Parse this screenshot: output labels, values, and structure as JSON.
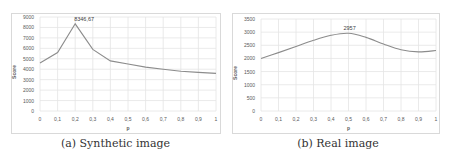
{
  "figure": {
    "captions": [
      "(a) Synthetic image",
      "(b) Real image"
    ]
  },
  "colors": {
    "line": "#8c8c8c",
    "grid": "#e4e4e4",
    "frame": "#d9d9d9",
    "tick_text": "#595959",
    "annotation": "#404040"
  },
  "chart_data": [
    {
      "type": "line",
      "title": "",
      "xlabel": "p",
      "ylabel": "Score",
      "x": [
        0,
        0.1,
        0.2,
        0.3,
        0.4,
        0.5,
        0.6,
        0.7,
        0.8,
        0.9,
        1
      ],
      "x_tick_labels": [
        "0",
        "0,1",
        "0,2",
        "0,3",
        "0,4",
        "0,5",
        "0,6",
        "0,7",
        "0,8",
        "0,9",
        "1"
      ],
      "values": [
        4600,
        5600,
        8346.67,
        5900,
        4800,
        4500,
        4200,
        4000,
        3800,
        3700,
        3600
      ],
      "ylim": [
        0,
        9000
      ],
      "y_ticks": [
        0,
        1000,
        2000,
        3000,
        4000,
        5000,
        6000,
        7000,
        8000,
        9000
      ],
      "annotation": {
        "x": 0.2,
        "y": 8346.67,
        "text": "8346,67"
      },
      "grid": true,
      "caption": "(a) Synthetic image"
    },
    {
      "type": "line",
      "title": "",
      "xlabel": "p",
      "ylabel": "Score",
      "x": [
        0,
        0.1,
        0.2,
        0.3,
        0.4,
        0.5,
        0.6,
        0.7,
        0.8,
        0.9,
        1
      ],
      "x_tick_labels": [
        "0",
        "0,1",
        "0,2",
        "0,3",
        "0,4",
        "0,5",
        "0,6",
        "0,7",
        "0,8",
        "0,9",
        "1"
      ],
      "values": [
        2000,
        2220,
        2450,
        2690,
        2880,
        2957,
        2800,
        2550,
        2330,
        2250,
        2300
      ],
      "ylim": [
        0,
        3500
      ],
      "y_ticks": [
        0,
        500,
        1000,
        1500,
        2000,
        2500,
        3000,
        3500
      ],
      "annotation": {
        "x": 0.5,
        "y": 2957,
        "text": "2957"
      },
      "grid": true,
      "smooth": true,
      "caption": "(b) Real image"
    }
  ]
}
